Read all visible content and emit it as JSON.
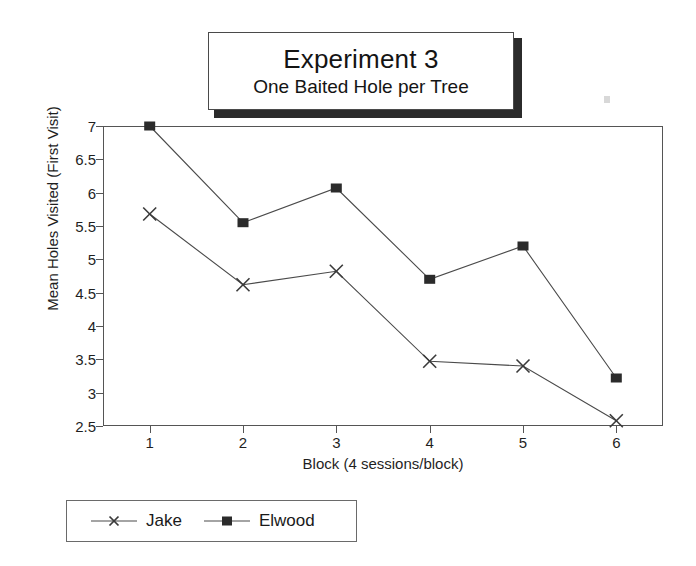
{
  "title": {
    "main": "Experiment 3",
    "subtitle": "One Baited Hole per Tree"
  },
  "axes": {
    "ylabel": "Mean Holes Visited (First Visit)",
    "xlabel": "Block (4 sessions/block)"
  },
  "legend": {
    "entries": [
      {
        "label": "Jake",
        "marker": "cross-marker",
        "color": "#3a3a3a"
      },
      {
        "label": "Elwood",
        "marker": "square-marker",
        "color": "#2b2b2b"
      }
    ]
  },
  "chart_data": {
    "type": "line",
    "title": "Experiment 3",
    "subtitle": "One Baited Hole per Tree",
    "xlabel": "Block (4 sessions/block)",
    "ylabel": "Mean Holes Visited (First Visit)",
    "categories": [
      "1",
      "2",
      "3",
      "4",
      "5",
      "6"
    ],
    "x": [
      1,
      2,
      3,
      4,
      5,
      6
    ],
    "xlim": [
      0.5,
      6.5
    ],
    "ylim": [
      2.5,
      7
    ],
    "yticks": [
      2.5,
      3,
      3.5,
      4,
      4.5,
      5,
      5.5,
      6,
      6.5,
      7
    ],
    "ytick_labels": [
      "2.5",
      "3",
      "3.5",
      "4",
      "4.5",
      "5",
      "5.5",
      "6",
      "6.5",
      "7"
    ],
    "grid": false,
    "legend_position": "below-left",
    "series": [
      {
        "name": "Jake",
        "marker": "x",
        "color": "#3a3a3a",
        "values": [
          5.68,
          4.62,
          4.82,
          3.47,
          3.4,
          2.58
        ]
      },
      {
        "name": "Elwood",
        "marker": "square",
        "color": "#2b2b2b",
        "values": [
          7.0,
          5.55,
          6.07,
          4.7,
          5.2,
          3.22
        ]
      }
    ]
  }
}
